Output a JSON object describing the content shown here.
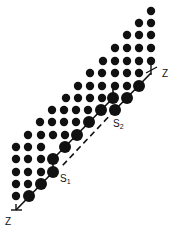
{
  "diagram": {
    "colors": {
      "dot": "#111111",
      "line": "#111111",
      "background": "#ffffff"
    },
    "small_dot_radius": 4.2,
    "large_dot_radius": 6,
    "small_dots": [
      [
        151,
        11
      ],
      [
        139,
        23
      ],
      [
        151,
        23
      ],
      [
        127,
        35
      ],
      [
        139,
        35
      ],
      [
        151,
        35
      ],
      [
        115,
        48
      ],
      [
        127,
        48
      ],
      [
        139,
        48
      ],
      [
        151,
        48
      ],
      [
        103,
        61
      ],
      [
        115,
        61
      ],
      [
        127,
        61
      ],
      [
        139,
        61
      ],
      [
        151,
        61
      ],
      [
        90,
        73
      ],
      [
        102,
        73
      ],
      [
        115,
        73
      ],
      [
        127,
        73
      ],
      [
        139,
        73
      ],
      [
        78,
        86
      ],
      [
        90,
        86
      ],
      [
        102,
        86
      ],
      [
        115,
        86
      ],
      [
        127,
        86
      ],
      [
        66,
        98
      ],
      [
        78,
        98
      ],
      [
        90,
        98
      ],
      [
        102,
        98
      ],
      [
        52,
        110
      ],
      [
        64,
        110
      ],
      [
        76,
        110
      ],
      [
        88,
        110
      ],
      [
        40,
        122
      ],
      [
        52,
        122
      ],
      [
        64,
        122
      ],
      [
        76,
        122
      ],
      [
        28,
        135
      ],
      [
        41,
        135
      ],
      [
        53,
        135
      ],
      [
        65,
        135
      ],
      [
        16,
        147
      ],
      [
        28,
        147
      ],
      [
        41,
        147
      ],
      [
        16,
        159
      ],
      [
        28,
        159
      ],
      [
        41,
        159
      ],
      [
        16,
        172
      ],
      [
        28,
        172
      ],
      [
        41,
        172
      ],
      [
        16,
        184
      ],
      [
        28,
        184
      ],
      [
        16,
        196
      ]
    ],
    "large_dots": [
      [
        139,
        86
      ],
      [
        127,
        98
      ],
      [
        115,
        110
      ],
      [
        113,
        98
      ],
      [
        101,
        110
      ],
      [
        89,
        122
      ],
      [
        77,
        135
      ],
      [
        65,
        147
      ],
      [
        53,
        159
      ],
      [
        53,
        172
      ],
      [
        41,
        184
      ],
      [
        29,
        196
      ]
    ],
    "lines": {
      "upper_solid": [
        [
          151,
          73
        ],
        [
          115,
          110
        ]
      ],
      "upper_dashed": [
        [
          115,
          110
        ],
        [
          62,
          166
        ]
      ],
      "lower_solid_a": [
        [
          113,
          86
        ],
        [
          113,
          98
        ]
      ],
      "lower_solid_b": [
        [
          113,
          98
        ],
        [
          53,
          159
        ]
      ],
      "lower_step": [
        [
          53,
          159
        ],
        [
          53,
          172
        ]
      ],
      "lower_solid_c": [
        [
          53,
          172
        ],
        [
          16,
          210
        ]
      ],
      "top_tick": [
        [
          146,
          73
        ],
        [
          157,
          67
        ]
      ],
      "top_axis": [
        [
          151,
          65
        ],
        [
          151,
          75
        ]
      ],
      "bottom_tick": [
        [
          11,
          210
        ],
        [
          22,
          210
        ]
      ],
      "bottom_axis": [
        [
          16,
          204
        ],
        [
          16,
          210
        ]
      ]
    },
    "labels": {
      "z_top": "Z",
      "z_bottom": "Z",
      "s1_main": "S",
      "s1_sub": "1",
      "s2_main": "S",
      "s2_sub": "2"
    }
  }
}
